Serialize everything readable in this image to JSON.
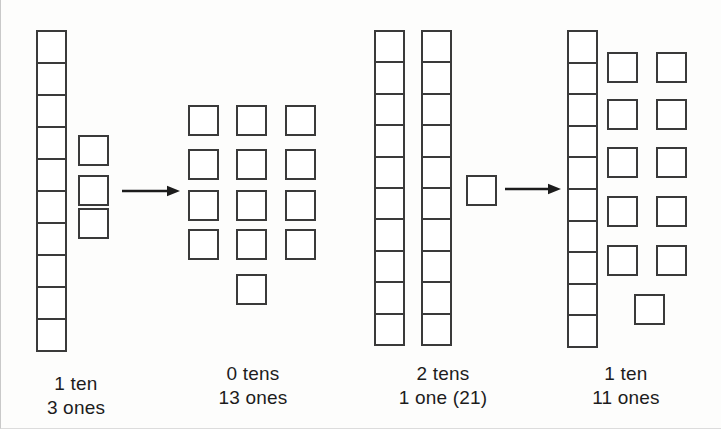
{
  "figure": {
    "title_text": "",
    "background_color": "#fdfdfc",
    "stroke_color": "#3a3a3a",
    "text_color": "#1c1c1c"
  },
  "groups": [
    {
      "id": "group-1-before",
      "caption_line_1": "1 ten",
      "caption_line_2": "3 ones",
      "tens": 1,
      "ones": 3,
      "rods": [
        {
          "x": 36,
          "y": 30,
          "w": 31,
          "h": 322,
          "cells": 10
        }
      ],
      "ones_squares": [
        {
          "x": 78,
          "y": 135,
          "s": 31
        },
        {
          "x": 78,
          "y": 175,
          "s": 31
        },
        {
          "x": 78,
          "y": 208,
          "s": 31
        }
      ],
      "caption_x": 20,
      "caption_y": 372,
      "caption_w": 112
    },
    {
      "id": "group-2-after",
      "caption_line_1": "0 tens",
      "caption_line_2": "13 ones",
      "tens": 0,
      "ones": 13,
      "rods": [],
      "ones_squares": [
        {
          "x": 188,
          "y": 105,
          "s": 31
        },
        {
          "x": 236,
          "y": 105,
          "s": 31
        },
        {
          "x": 285,
          "y": 105,
          "s": 31
        },
        {
          "x": 188,
          "y": 149,
          "s": 31
        },
        {
          "x": 236,
          "y": 149,
          "s": 31
        },
        {
          "x": 285,
          "y": 149,
          "s": 31
        },
        {
          "x": 188,
          "y": 190,
          "s": 31
        },
        {
          "x": 236,
          "y": 190,
          "s": 31
        },
        {
          "x": 285,
          "y": 190,
          "s": 31
        },
        {
          "x": 188,
          "y": 229,
          "s": 31
        },
        {
          "x": 236,
          "y": 229,
          "s": 31
        },
        {
          "x": 285,
          "y": 229,
          "s": 31
        },
        {
          "x": 236,
          "y": 274,
          "s": 31
        }
      ],
      "caption_x": 192,
      "caption_y": 362,
      "caption_w": 122
    },
    {
      "id": "group-3-before",
      "caption_line_1": "2 tens",
      "caption_line_2": "1 one (21)",
      "tens": 2,
      "ones": 1,
      "rods": [
        {
          "x": 374,
          "y": 30,
          "w": 31,
          "h": 316,
          "cells": 10
        },
        {
          "x": 421,
          "y": 30,
          "w": 31,
          "h": 316,
          "cells": 10
        }
      ],
      "ones_squares": [
        {
          "x": 466,
          "y": 175,
          "s": 31
        }
      ],
      "caption_x": 372,
      "caption_y": 362,
      "caption_w": 142
    },
    {
      "id": "group-4-after",
      "caption_line_1": "1 ten",
      "caption_line_2": "11 ones",
      "tens": 1,
      "ones": 11,
      "rods": [
        {
          "x": 567,
          "y": 30,
          "w": 31,
          "h": 318,
          "cells": 10
        }
      ],
      "ones_squares": [
        {
          "x": 607,
          "y": 52,
          "s": 31
        },
        {
          "x": 656,
          "y": 52,
          "s": 31
        },
        {
          "x": 607,
          "y": 99,
          "s": 31
        },
        {
          "x": 656,
          "y": 99,
          "s": 31
        },
        {
          "x": 607,
          "y": 147,
          "s": 31
        },
        {
          "x": 656,
          "y": 147,
          "s": 31
        },
        {
          "x": 607,
          "y": 196,
          "s": 31
        },
        {
          "x": 656,
          "y": 196,
          "s": 31
        },
        {
          "x": 607,
          "y": 245,
          "s": 31
        },
        {
          "x": 656,
          "y": 245,
          "s": 31
        },
        {
          "x": 634,
          "y": 294,
          "s": 31
        }
      ],
      "caption_x": 565,
      "caption_y": 362,
      "caption_w": 122
    }
  ],
  "arrows": [
    {
      "id": "arrow-1",
      "x": 122,
      "y": 184,
      "w": 58,
      "h": 14,
      "label": "regroup-arrow"
    },
    {
      "id": "arrow-2",
      "x": 505,
      "y": 182,
      "w": 56,
      "h": 14,
      "label": "regroup-arrow"
    }
  ]
}
